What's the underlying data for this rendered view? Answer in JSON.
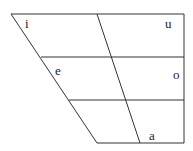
{
  "diagram": {
    "type": "vowel-chart",
    "vowels": [
      {
        "symbol": "i",
        "position": "close-front"
      },
      {
        "symbol": "u",
        "position": "close-back"
      },
      {
        "symbol": "e",
        "position": "mid-front"
      },
      {
        "symbol": "o",
        "position": "mid-back"
      },
      {
        "symbol": "a",
        "position": "open-central"
      }
    ],
    "line_color": "#333333"
  }
}
